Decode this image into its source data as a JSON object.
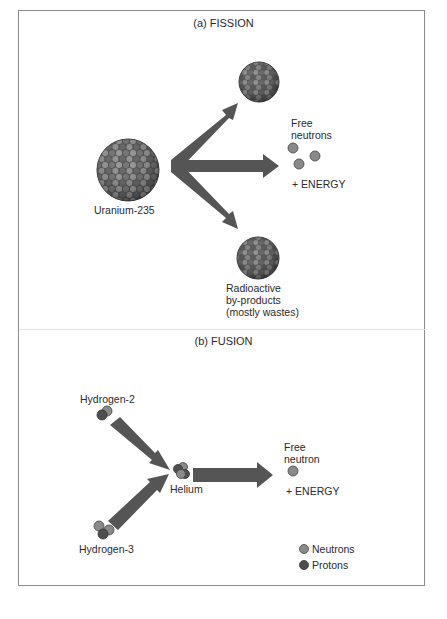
{
  "fission": {
    "title": "(a) FISSION",
    "uranium_label": "Uranium-235",
    "free_neutrons_label_1": "Free",
    "free_neutrons_label_2": "neutrons",
    "energy_label": "+ ENERGY",
    "byproducts_label_1": "Radioactive",
    "byproducts_label_2": "by-products",
    "byproducts_label_3": "(mostly wastes)"
  },
  "fusion": {
    "title": "(b) FUSION",
    "hydrogen2_label": "Hydrogen-2",
    "hydrogen3_label": "Hydrogen-3",
    "helium_label": "Helium",
    "free_neutron_label_1": "Free",
    "free_neutron_label_2": "neutron",
    "energy_label": "+ ENERGY"
  },
  "legend": {
    "neutrons_label": "Neutrons",
    "protons_label": "Protons"
  },
  "colors": {
    "neutron": "#8a8a8a",
    "proton": "#4e4e4e",
    "arrow": "#555555",
    "outline": "#3a3a3a",
    "frame": "#8c8c8c"
  }
}
